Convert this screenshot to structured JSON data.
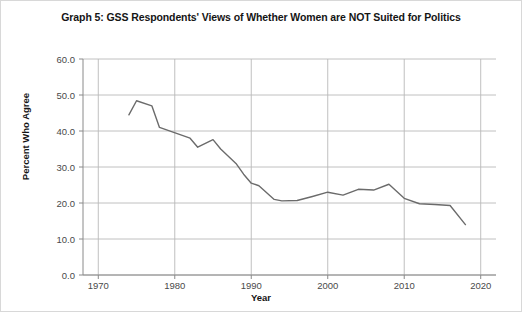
{
  "chart_data": {
    "type": "line",
    "title": "Graph 5: GSS Respondents' Views of Whether Women are NOT Suited for Politics",
    "xlabel": "Year",
    "ylabel": "Percent Who Agree",
    "xlim": [
      1968,
      2022
    ],
    "ylim": [
      0.0,
      60.0
    ],
    "xticks": [
      1970,
      1980,
      1990,
      2000,
      2010,
      2020
    ],
    "xtick_labels": [
      "1970",
      "1980",
      "1990",
      "2000",
      "2010",
      "2020"
    ],
    "yticks": [
      0.0,
      10.0,
      20.0,
      30.0,
      40.0,
      50.0,
      60.0
    ],
    "ytick_labels": [
      "0.0",
      "10.0",
      "20.0",
      "30.0",
      "40.0",
      "50.0",
      "60.0"
    ],
    "grid": true,
    "legend": false,
    "line_color": "#6b6b6b",
    "grid_color": "#b9b9b9",
    "series": [
      {
        "name": "Percent Who Agree",
        "x": [
          1974,
          1975,
          1977,
          1978,
          1982,
          1983,
          1985,
          1986,
          1988,
          1989,
          1990,
          1991,
          1993,
          1994,
          1996,
          1998,
          2000,
          2002,
          2004,
          2006,
          2008,
          2010,
          2012,
          2014,
          2016,
          2018
        ],
        "values": [
          44.5,
          48.4,
          47.0,
          41.0,
          38.0,
          35.5,
          37.6,
          35.0,
          31.0,
          28.0,
          25.5,
          24.8,
          21.0,
          20.6,
          20.7,
          21.8,
          23.0,
          22.2,
          23.8,
          23.6,
          25.2,
          21.3,
          19.8,
          19.6,
          19.3,
          14.0
        ]
      }
    ]
  }
}
